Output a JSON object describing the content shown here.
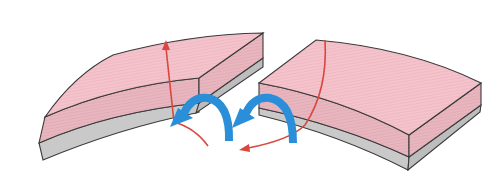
{
  "diagram": {
    "colors": {
      "top_layer": "#f4c3cc",
      "top_layer_side": "#e8b4bd",
      "bottom_layer": "#c8c8c8",
      "outline": "#3a3a3a",
      "red_arrow": "#d9473f",
      "blue_arrow": "#2a8fd8",
      "background": "#ffffff"
    },
    "elements": {
      "left_slab": "curved-slab-left",
      "right_slab": "curved-slab-right",
      "blue_arrows": 2,
      "red_arrows": 2
    }
  }
}
